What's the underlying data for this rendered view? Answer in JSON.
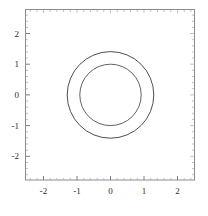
{
  "chart_data": {
    "type": "line",
    "title": "",
    "xlabel": "",
    "ylabel": "",
    "xlim": [
      -2.8,
      2.8
    ],
    "ylim": [
      -2.8,
      2.8
    ],
    "grid": false,
    "legend": null,
    "frame": true,
    "x_ticks": [
      "-2",
      "-1",
      "0",
      "1",
      "2"
    ],
    "x_tick_values": [
      -2,
      -1,
      0,
      1,
      2
    ],
    "y_ticks": [
      "2",
      "1",
      "0",
      "-1",
      "-2"
    ],
    "y_tick_values": [
      2,
      1,
      0,
      -1,
      -2
    ],
    "series": [
      {
        "name": "outer-circle",
        "shape": "circle",
        "center": [
          0,
          0
        ],
        "radius": 1.41,
        "color": "#3a3a3a",
        "linewidth": 0.9
      },
      {
        "name": "inner-circle",
        "shape": "circle",
        "center": [
          0,
          0
        ],
        "radius": 1.0,
        "color": "#3a3a3a",
        "linewidth": 0.8
      }
    ],
    "annotations": []
  },
  "axes": {
    "x_tick_labels": [
      "-2",
      "-1",
      "0",
      "1",
      "2"
    ],
    "y_tick_labels": [
      "2",
      "1",
      "0",
      "-1",
      "-2"
    ]
  },
  "colors": {
    "background": "#ffffff",
    "frame": "#8c8c8c",
    "curve": "#3a3a3a",
    "tick_text": "#2b2b2b"
  }
}
